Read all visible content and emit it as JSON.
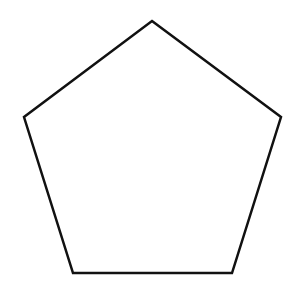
{
  "diagram": {
    "shape": "regular-pentagon",
    "vertices": [
      [
        152,
        21
      ],
      [
        281,
        117
      ],
      [
        232,
        273
      ],
      [
        73,
        273
      ],
      [
        24,
        117
      ]
    ],
    "stroke_color": "#111111",
    "stroke_width": 2.5,
    "fill_color": "#ffffff",
    "background": "#ffffff"
  }
}
